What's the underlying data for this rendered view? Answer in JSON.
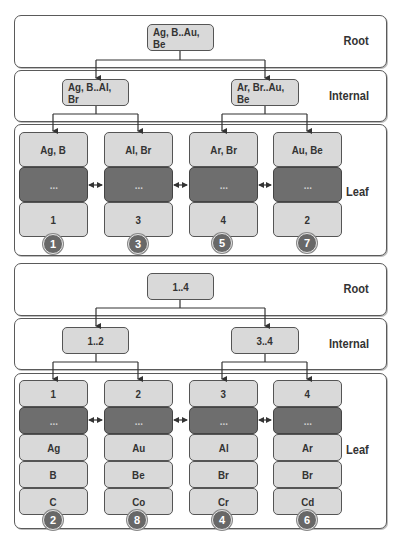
{
  "diagrams": [
    {
      "levels": {
        "root": "Root",
        "internal": "Internal",
        "leaf": "Leaf"
      },
      "root_node": "Ag, B..Au, Be",
      "internal_nodes": [
        "Ag, B..Al, Br",
        "Ar, Br..Au, Be"
      ],
      "leaves": [
        {
          "cells": [
            "Ag, B",
            "...",
            "1"
          ],
          "badge": "1"
        },
        {
          "cells": [
            "Al, Br",
            "...",
            "3"
          ],
          "badge": "3"
        },
        {
          "cells": [
            "Ar, Br",
            "...",
            "4"
          ],
          "badge": "5"
        },
        {
          "cells": [
            "Au, Be",
            "...",
            "2"
          ],
          "badge": "7"
        }
      ]
    },
    {
      "levels": {
        "root": "Root",
        "internal": "Internal",
        "leaf": "Leaf"
      },
      "root_node": "1..4",
      "internal_nodes": [
        "1..2",
        "3..4"
      ],
      "leaves": [
        {
          "cells": [
            "1",
            "...",
            "Ag",
            "B",
            "C"
          ],
          "badge": "2"
        },
        {
          "cells": [
            "2",
            "...",
            "Au",
            "Be",
            "Co"
          ],
          "badge": "8"
        },
        {
          "cells": [
            "3",
            "...",
            "Al",
            "Br",
            "Cr"
          ],
          "badge": "4"
        },
        {
          "cells": [
            "4",
            "...",
            "Ar",
            "Br",
            "Cd"
          ],
          "badge": "6"
        }
      ]
    }
  ],
  "colors": {
    "node_fill": "#d9d9d9",
    "dark_cell_fill": "#6e6e6e",
    "badge_fill": "#686868",
    "border": "#555555"
  }
}
